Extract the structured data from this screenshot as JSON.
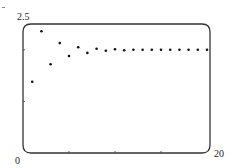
{
  "chart_data": {
    "type": "scatter",
    "title": "",
    "xlabel": "",
    "ylabel": "",
    "xlim": [
      0,
      20
    ],
    "ylim": [
      0,
      2.5
    ],
    "x_tick_labels": [
      "0",
      "20"
    ],
    "y_tick_labels": [
      "2.5"
    ],
    "x_minor_ticks": [
      5,
      10,
      15
    ],
    "y_minor_ticks": [
      1,
      2
    ],
    "grid": false,
    "legend": null,
    "series": [
      {
        "name": "sequence",
        "x": [
          1,
          2,
          3,
          4,
          5,
          6,
          7,
          8,
          9,
          10,
          11,
          12,
          13,
          14,
          15,
          16,
          17,
          18,
          19,
          20
        ],
        "values": [
          1.38,
          2.36,
          1.72,
          2.13,
          1.88,
          2.05,
          1.94,
          2.02,
          1.98,
          2.01,
          1.99,
          2.0,
          2.0,
          2.0,
          2.0,
          2.0,
          2.0,
          2.0,
          2.0,
          2.0
        ]
      }
    ],
    "colors": {
      "frame": "#333333",
      "points": "#111111"
    }
  },
  "labels": {
    "y_max": "2.5",
    "x_min": "0",
    "x_max": "20"
  }
}
